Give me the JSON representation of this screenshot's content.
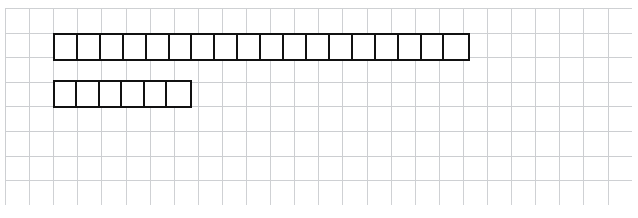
{
  "diagram": {
    "type": "bar-model",
    "background_color": "#ffffff",
    "grid": {
      "name": "graph-paper-grid",
      "visible": true,
      "line_color": "#b9bcc0",
      "cell_size_px": 24,
      "columns": 26,
      "rows": 8,
      "left_px": 5,
      "top_px": 8,
      "width_px": 627,
      "height_px": 197
    },
    "bars": [
      {
        "name": "long-bar",
        "label": "",
        "cells": 18,
        "cell_width_px": 23.2,
        "left_px": 53,
        "top_px": 33,
        "width_px": 417,
        "height_px": 28,
        "stroke_color": "#111111",
        "stroke_width_px": 2.3,
        "fill_color": "#ffffff"
      },
      {
        "name": "short-bar",
        "label": "",
        "cells": 6,
        "cell_width_px": 23.2,
        "left_px": 53,
        "top_px": 80,
        "width_px": 139,
        "height_px": 28,
        "stroke_color": "#111111",
        "stroke_width_px": 2.3,
        "fill_color": "#ffffff"
      }
    ],
    "ratio": "18 : 6",
    "notes": ""
  }
}
